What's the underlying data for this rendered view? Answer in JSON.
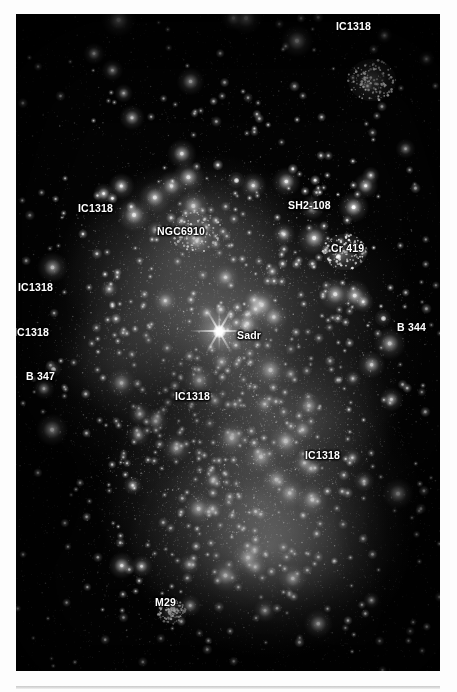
{
  "image": {
    "alt_name": "sadr-region-starfield",
    "frame": {
      "x": 16,
      "y": 14,
      "width": 424,
      "height": 657
    },
    "background_color": "#000000",
    "label_color": "#ffffff"
  },
  "labels": [
    {
      "text": "IC1318",
      "x": 336,
      "y": 20,
      "name": "label-ic1318-top-right"
    },
    {
      "text": "IC1318",
      "x": 78,
      "y": 202,
      "name": "label-ic1318-upper-left"
    },
    {
      "text": "NGC6910",
      "x": 157,
      "y": 225,
      "name": "label-ngc6910"
    },
    {
      "text": "SH2-108",
      "x": 288,
      "y": 199,
      "name": "label-sh2-108"
    },
    {
      "text": "Cr 419",
      "x": 331,
      "y": 242,
      "name": "label-cr-419"
    },
    {
      "text": "IC1318",
      "x": 18,
      "y": 281,
      "name": "label-ic1318-left-upper"
    },
    {
      "text": "IC1318",
      "x": 14,
      "y": 326,
      "name": "label-ic1318-left-lower"
    },
    {
      "text": "Sadr",
      "x": 237,
      "y": 329,
      "name": "label-sadr"
    },
    {
      "text": "B 344",
      "x": 397,
      "y": 321,
      "name": "label-b-344"
    },
    {
      "text": "B 347",
      "x": 26,
      "y": 370,
      "name": "label-b-347"
    },
    {
      "text": "IC1318",
      "x": 175,
      "y": 390,
      "name": "label-ic1318-center"
    },
    {
      "text": "IC1318",
      "x": 305,
      "y": 449,
      "name": "label-ic1318-lower-right"
    },
    {
      "text": "M29",
      "x": 155,
      "y": 596,
      "name": "label-m29"
    }
  ],
  "objects": {
    "sadr": {
      "x": 219,
      "y": 331,
      "name": "sadr-bright-star"
    },
    "bright_stars": [
      {
        "x": 383,
        "y": 318,
        "name": "star-near-b344"
      },
      {
        "x": 53,
        "y": 369,
        "name": "star-near-b347"
      },
      {
        "x": 236,
        "y": 180,
        "name": "star-ngc6910-bright"
      },
      {
        "x": 338,
        "y": 256,
        "name": "star-cr419-bright"
      }
    ],
    "clusters": [
      {
        "x": 196,
        "y": 232,
        "w": 52,
        "h": 40,
        "name": "cluster-ngc6910"
      },
      {
        "x": 345,
        "y": 252,
        "w": 44,
        "h": 36,
        "name": "cluster-cr419"
      },
      {
        "x": 172,
        "y": 612,
        "w": 30,
        "h": 24,
        "name": "cluster-m29"
      },
      {
        "x": 372,
        "y": 80,
        "w": 48,
        "h": 42,
        "name": "cluster-upper-right"
      }
    ]
  }
}
